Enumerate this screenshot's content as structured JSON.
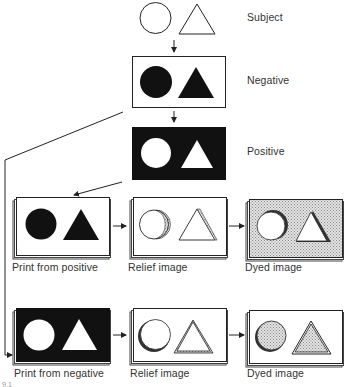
{
  "diagram": {
    "type": "process-flow",
    "stages": {
      "subject": {
        "label": "Subject"
      },
      "negative": {
        "label": "Negative"
      },
      "positive": {
        "label": "Positive"
      }
    },
    "row_positive": [
      {
        "label": "Print from positive"
      },
      {
        "label": "Relief image"
      },
      {
        "label": "Dyed image"
      }
    ],
    "row_negative": [
      {
        "label": "Print from negative"
      },
      {
        "label": "Relief image"
      },
      {
        "label": "Dyed image"
      }
    ],
    "figure_number": "9.1"
  }
}
